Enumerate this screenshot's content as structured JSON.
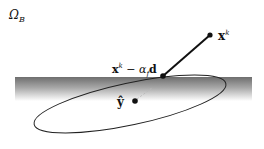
{
  "diagram": {
    "region_label": {
      "main": "Ω",
      "sub": "B"
    },
    "points": {
      "xk": {
        "main": "x",
        "sup": "k",
        "cx": 210,
        "cy": 35
      },
      "step": {
        "main": "x",
        "sup": "k",
        "rest": " − α",
        "alpha_sub": "f",
        "dir": "d",
        "cx": 163,
        "cy": 76
      },
      "yhat": {
        "main": "ŷ",
        "cx": 135,
        "cy": 101
      }
    },
    "band": {
      "x": 15,
      "y": 77,
      "width": 237,
      "height": 24,
      "top_color": "#7a7a7a",
      "bottom_color": "#ffffff"
    },
    "ellipse": {
      "cx": 130,
      "cy": 104,
      "rx": 98,
      "ry": 21,
      "rotate": -12,
      "stroke": "#222222"
    },
    "colors": {
      "ink": "#111111"
    }
  }
}
